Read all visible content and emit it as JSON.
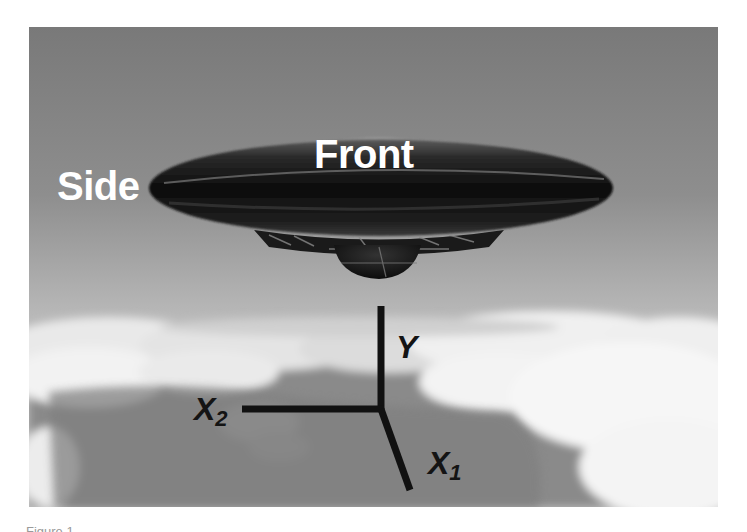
{
  "figure": {
    "labels": {
      "side": "Side",
      "front": "Front"
    },
    "axes": {
      "y": "Y",
      "x2_base": "X",
      "x2_sub": "2",
      "x1_base": "X",
      "x1_sub": "1"
    },
    "colors": {
      "sky": "#7d7d7d",
      "cloud": "#f2f2f2",
      "cloud_shadow": "#8a8a8a",
      "saucer": "#141414",
      "axis": "#111111",
      "label_text": "#ffffff"
    }
  },
  "caption": {
    "text": "Figure 1"
  }
}
